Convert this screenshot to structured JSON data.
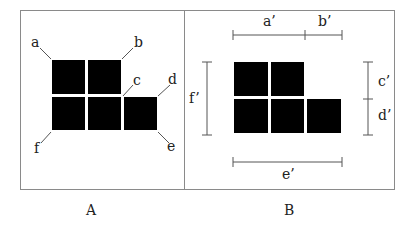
{
  "panels": [
    {
      "id": "A",
      "caption": "A",
      "corner_labels": {
        "a": "a",
        "b": "b",
        "c": "c",
        "d": "d",
        "e": "e",
        "f": "f"
      }
    },
    {
      "id": "B",
      "caption": "B",
      "dimension_labels": {
        "a_prime": "a’",
        "b_prime": "b’",
        "c_prime": "c’",
        "d_prime": "d’",
        "e_prime": "e’",
        "f_prime": "f’"
      }
    }
  ],
  "shape": {
    "description": "L-shaped arrangement of 5 black squares: 2 on top row, 3 on bottom row",
    "rows": [
      2,
      3
    ],
    "fill_color": "#000000",
    "border_color": "#8a8a8a"
  }
}
